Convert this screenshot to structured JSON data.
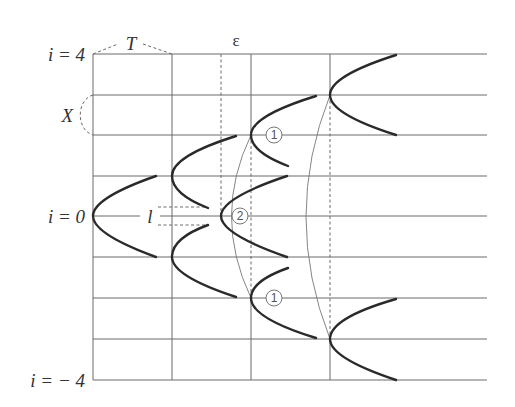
{
  "diagram": {
    "type": "spacetime lattice / parabola propagation diagram",
    "labels": {
      "i_top": "i = 4",
      "i_mid": "i = 0",
      "i_bottom": "i = − 4",
      "period": "T",
      "spacing": "X",
      "epsilon": "ε",
      "length": "l",
      "marker_1": "1",
      "marker_2": "2"
    },
    "rows": [
      4,
      3,
      2,
      1,
      0,
      -1,
      -2,
      -3,
      -4
    ],
    "row_y": [
      54,
      95,
      135,
      176,
      216,
      257,
      298,
      339,
      380
    ],
    "columns_x": [
      93,
      172,
      221,
      251,
      330
    ],
    "colors": {
      "grid": "#6a6a6a",
      "curve": "#2a2a2a",
      "thin_arc": "#777777"
    }
  }
}
